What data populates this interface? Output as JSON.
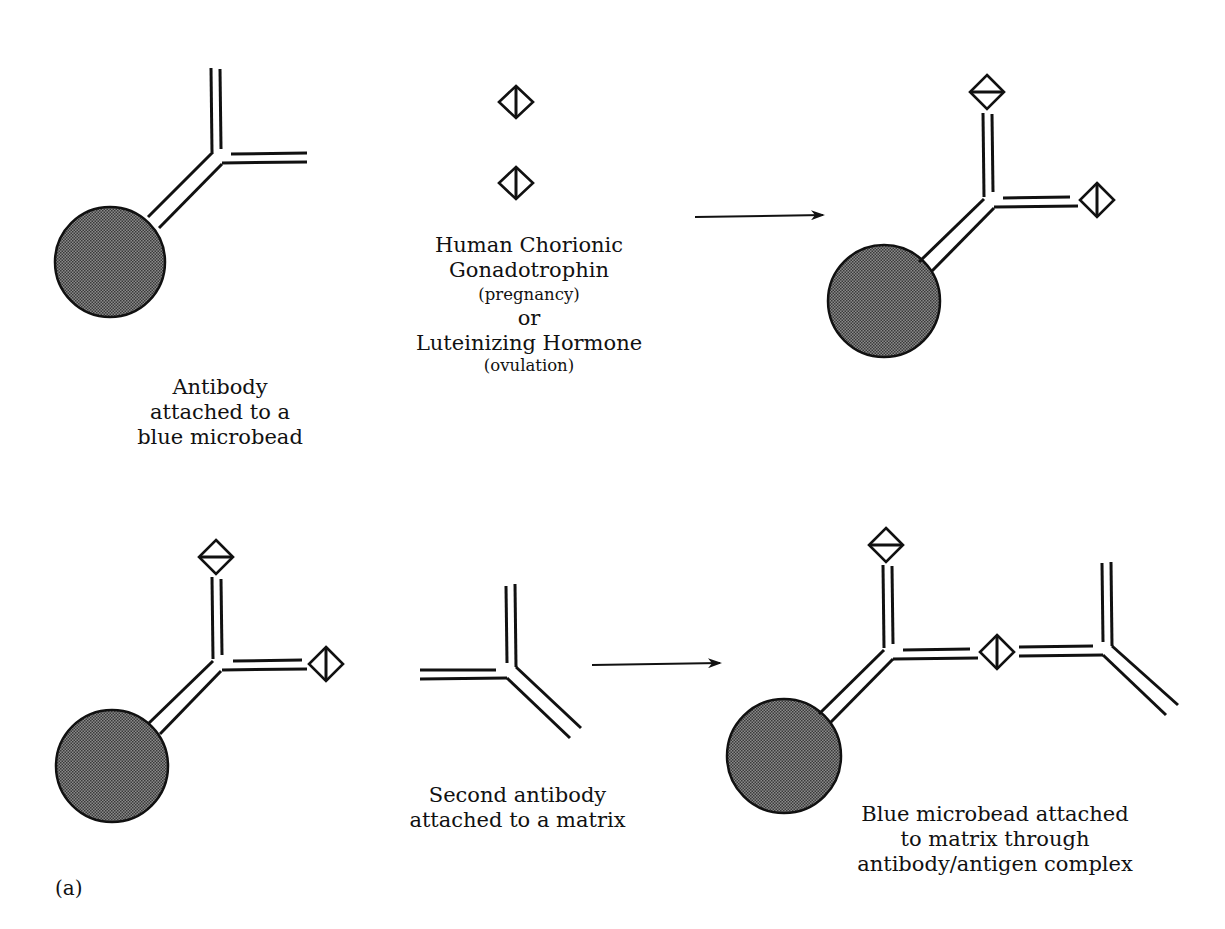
{
  "figure": {
    "panel_label": "(a)",
    "colors": {
      "ink": "#111111",
      "bead_fill": "#6a6a6a",
      "background": "#ffffff"
    },
    "top_row": {
      "antibody_caption": [
        "Antibody",
        "attached to a",
        "blue microbead"
      ],
      "antigen_caption": {
        "line1": "Human Chorionic",
        "line2": "Gonadotrophin",
        "line3": "(pregnancy)",
        "line4": "or",
        "line5": "Luteinizing Hormone",
        "line6": "(ovulation)"
      },
      "arrow": "reaction-arrow"
    },
    "bottom_row": {
      "matrix_caption": [
        "Second antibody",
        "attached to a matrix"
      ],
      "result_caption": [
        "Blue microbead attached",
        "to matrix through",
        "antibody/antigen complex"
      ],
      "arrow": "reaction-arrow"
    },
    "icons": {
      "bead": "microbead-icon",
      "antibody": "y-antibody-icon",
      "antigen_vertical": "diamond-vertical-bar-icon",
      "antigen_horizontal": "diamond-horizontal-bar-icon"
    }
  }
}
